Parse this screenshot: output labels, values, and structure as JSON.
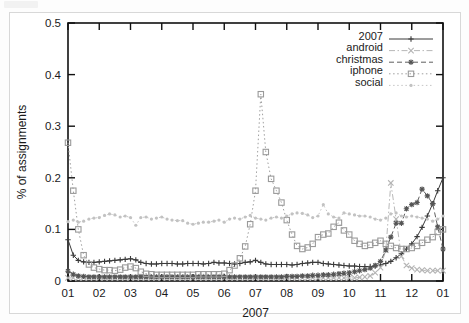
{
  "figure": {
    "background_color": "#ffffff",
    "plot_border_color": "#111111",
    "width": 469,
    "height": 323
  },
  "axes": {
    "y_title": "% of assignments",
    "x_title": "2007",
    "y_ticks": [
      "0",
      "0.1",
      "0.2",
      "0.3",
      "0.4",
      "0.5"
    ],
    "x_ticks": [
      "01",
      "02",
      "03",
      "04",
      "05",
      "06",
      "07",
      "08",
      "09",
      "10",
      "11",
      "12",
      "01"
    ]
  },
  "legend": {
    "items": [
      {
        "label": "2007",
        "style": "solid",
        "marker": "plus",
        "color": "#3a3a3a"
      },
      {
        "label": "android",
        "style": "dashdot",
        "marker": "cross",
        "color": "#b4b4b4"
      },
      {
        "label": "christmas",
        "style": "dashed",
        "marker": "asterisk",
        "color": "#555555"
      },
      {
        "label": "iphone",
        "style": "dotted",
        "marker": "square",
        "color": "#9a9a9a"
      },
      {
        "label": "social",
        "style": "dotted",
        "marker": "dot",
        "color": "#c2c2c2"
      }
    ]
  },
  "chart_data": {
    "type": "line",
    "title": "",
    "xlabel": "2007",
    "ylabel": "% of assignments",
    "xlim": [
      1,
      13
    ],
    "ylim": [
      0,
      0.5
    ],
    "grid": false,
    "legend_position": "top-right",
    "x_tick_labels": [
      "01",
      "02",
      "03",
      "04",
      "05",
      "06",
      "07",
      "08",
      "09",
      "10",
      "11",
      "12",
      "01"
    ],
    "x_tick_values": [
      1,
      2,
      3,
      4,
      5,
      6,
      7,
      8,
      9,
      10,
      11,
      12,
      13
    ],
    "y_tick_values": [
      0,
      0.1,
      0.2,
      0.3,
      0.4,
      0.5
    ],
    "x": [
      1.0,
      1.17,
      1.33,
      1.5,
      1.67,
      1.83,
      2.0,
      2.17,
      2.33,
      2.5,
      2.67,
      2.83,
      3.0,
      3.17,
      3.33,
      3.5,
      3.67,
      3.83,
      4.0,
      4.17,
      4.33,
      4.5,
      4.67,
      4.83,
      5.0,
      5.17,
      5.33,
      5.5,
      5.67,
      5.83,
      6.0,
      6.17,
      6.33,
      6.5,
      6.67,
      6.83,
      7.0,
      7.17,
      7.33,
      7.5,
      7.67,
      7.83,
      8.0,
      8.17,
      8.33,
      8.5,
      8.67,
      8.83,
      9.0,
      9.17,
      9.33,
      9.5,
      9.67,
      9.83,
      10.0,
      10.17,
      10.33,
      10.5,
      10.67,
      10.83,
      11.0,
      11.17,
      11.33,
      11.5,
      11.67,
      11.83,
      12.0,
      12.17,
      12.33,
      12.5,
      12.67,
      12.83,
      13.0
    ],
    "series": [
      {
        "name": "2007",
        "marker": "plus",
        "line_style": "solid",
        "color": "#3a3a3a",
        "values": [
          0.08,
          0.05,
          0.04,
          0.037,
          0.036,
          0.036,
          0.037,
          0.038,
          0.039,
          0.04,
          0.041,
          0.042,
          0.043,
          0.041,
          0.036,
          0.034,
          0.033,
          0.033,
          0.034,
          0.034,
          0.034,
          0.033,
          0.033,
          0.034,
          0.034,
          0.034,
          0.033,
          0.034,
          0.036,
          0.035,
          0.035,
          0.034,
          0.033,
          0.034,
          0.036,
          0.037,
          0.04,
          0.036,
          0.033,
          0.032,
          0.032,
          0.032,
          0.032,
          0.031,
          0.032,
          0.034,
          0.035,
          0.036,
          0.036,
          0.034,
          0.033,
          0.032,
          0.031,
          0.03,
          0.029,
          0.029,
          0.028,
          0.028,
          0.028,
          0.029,
          0.031,
          0.034,
          0.038,
          0.045,
          0.053,
          0.062,
          0.072,
          0.086,
          0.104,
          0.126,
          0.15,
          0.175,
          0.2
        ]
      },
      {
        "name": "android",
        "marker": "cross",
        "line_style": "dashdot",
        "color": "#b4b4b4",
        "values": [
          0.006,
          0.006,
          0.006,
          0.006,
          0.006,
          0.006,
          0.006,
          0.006,
          0.006,
          0.006,
          0.006,
          0.006,
          0.006,
          0.006,
          0.006,
          0.006,
          0.006,
          0.006,
          0.006,
          0.006,
          0.006,
          0.006,
          0.006,
          0.006,
          0.006,
          0.006,
          0.006,
          0.006,
          0.006,
          0.006,
          0.006,
          0.006,
          0.006,
          0.006,
          0.006,
          0.006,
          0.006,
          0.006,
          0.006,
          0.006,
          0.006,
          0.006,
          0.006,
          0.006,
          0.006,
          0.006,
          0.006,
          0.006,
          0.006,
          0.006,
          0.006,
          0.006,
          0.006,
          0.006,
          0.006,
          0.006,
          0.007,
          0.008,
          0.01,
          0.016,
          0.026,
          0.06,
          0.19,
          0.12,
          0.048,
          0.03,
          0.025,
          0.022,
          0.021,
          0.02,
          0.02,
          0.02,
          0.02
        ]
      },
      {
        "name": "christmas",
        "marker": "asterisk",
        "line_style": "dashed",
        "color": "#555555",
        "values": [
          0.019,
          0.013,
          0.01,
          0.009,
          0.008,
          0.008,
          0.008,
          0.008,
          0.008,
          0.008,
          0.008,
          0.008,
          0.008,
          0.008,
          0.008,
          0.008,
          0.008,
          0.008,
          0.008,
          0.008,
          0.008,
          0.008,
          0.008,
          0.008,
          0.008,
          0.008,
          0.008,
          0.008,
          0.008,
          0.008,
          0.008,
          0.008,
          0.008,
          0.008,
          0.008,
          0.008,
          0.008,
          0.008,
          0.008,
          0.008,
          0.008,
          0.008,
          0.009,
          0.009,
          0.009,
          0.01,
          0.01,
          0.011,
          0.011,
          0.012,
          0.012,
          0.013,
          0.014,
          0.015,
          0.016,
          0.018,
          0.02,
          0.022,
          0.025,
          0.03,
          0.038,
          0.06,
          0.085,
          0.112,
          0.112,
          0.14,
          0.148,
          0.152,
          0.178,
          0.165,
          0.15,
          0.105,
          0.062
        ]
      },
      {
        "name": "iphone",
        "marker": "square",
        "line_style": "dotted",
        "color": "#9a9a9a",
        "values": [
          0.268,
          0.175,
          0.1,
          0.05,
          0.032,
          0.026,
          0.023,
          0.021,
          0.021,
          0.02,
          0.022,
          0.026,
          0.028,
          0.025,
          0.018,
          0.014,
          0.013,
          0.012,
          0.012,
          0.012,
          0.012,
          0.012,
          0.012,
          0.012,
          0.012,
          0.013,
          0.013,
          0.013,
          0.013,
          0.013,
          0.014,
          0.021,
          0.03,
          0.044,
          0.067,
          0.11,
          0.175,
          0.362,
          0.25,
          0.198,
          0.175,
          0.152,
          0.118,
          0.09,
          0.068,
          0.062,
          0.065,
          0.072,
          0.085,
          0.09,
          0.092,
          0.105,
          0.113,
          0.098,
          0.09,
          0.078,
          0.072,
          0.068,
          0.07,
          0.074,
          0.078,
          0.072,
          0.068,
          0.064,
          0.062,
          0.062,
          0.064,
          0.068,
          0.074,
          0.08,
          0.085,
          0.095,
          0.1
        ]
      },
      {
        "name": "social",
        "marker": "dot",
        "line_style": "dotted",
        "color": "#c2c2c2",
        "values": [
          0.115,
          0.118,
          0.114,
          0.116,
          0.12,
          0.122,
          0.123,
          0.127,
          0.13,
          0.128,
          0.124,
          0.126,
          0.123,
          0.108,
          0.123,
          0.124,
          0.12,
          0.122,
          0.124,
          0.12,
          0.118,
          0.117,
          0.117,
          0.112,
          0.11,
          0.112,
          0.114,
          0.114,
          0.116,
          0.118,
          0.114,
          0.12,
          0.122,
          0.12,
          0.124,
          0.127,
          0.122,
          0.12,
          0.118,
          0.122,
          0.124,
          0.122,
          0.126,
          0.13,
          0.132,
          0.131,
          0.128,
          0.123,
          0.126,
          0.148,
          0.13,
          0.124,
          0.122,
          0.132,
          0.13,
          0.128,
          0.126,
          0.126,
          0.124,
          0.12,
          0.118,
          0.122,
          0.13,
          0.132,
          0.126,
          0.124,
          0.126,
          0.124,
          0.122,
          0.12,
          0.116,
          0.12,
          0.126
        ]
      }
    ]
  }
}
